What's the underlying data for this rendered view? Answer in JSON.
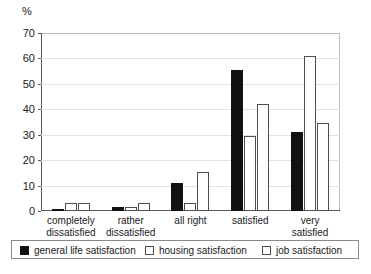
{
  "chart_data": {
    "type": "bar",
    "title": "",
    "xlabel": "",
    "ylabel": "%",
    "ylim": [
      0,
      70
    ],
    "yticks": [
      0,
      10,
      20,
      30,
      40,
      50,
      60,
      70
    ],
    "grid": true,
    "legend_position": "bottom",
    "categories": [
      "completely\ndissatisfied",
      "rather\ndissatisfied",
      "all right",
      "satisfied",
      "very\nsatisfied"
    ],
    "series": [
      {
        "name": "general life satisfaction",
        "style": "filled-black",
        "color": "#111111",
        "values": [
          0.7,
          1.4,
          11.0,
          55.5,
          31.0
        ]
      },
      {
        "name": "housing satisfaction",
        "style": "white-outline",
        "color": "#ffffff",
        "values": [
          3.3,
          1.6,
          3.0,
          29.5,
          61.0
        ]
      },
      {
        "name": "job satisfaction",
        "style": "white-outline",
        "color": "#ffffff",
        "values": [
          3.3,
          3.3,
          15.5,
          42.0,
          34.8
        ]
      }
    ]
  },
  "axis": {
    "unit_label": "%"
  },
  "legend": {
    "items": [
      {
        "label": "general life satisfaction",
        "style": "dark"
      },
      {
        "label": "housing satisfaction",
        "style": "light"
      },
      {
        "label": "job satisfaction",
        "style": "light"
      }
    ]
  }
}
